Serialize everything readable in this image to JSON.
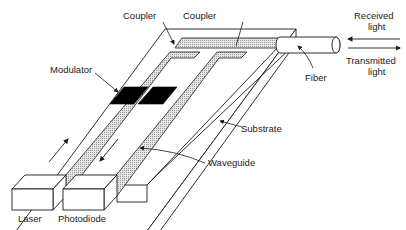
{
  "diagram": {
    "labels": {
      "coupler_left": "Coupler",
      "coupler_right": "Coupler",
      "modulator": "Modulator",
      "fiber": "Fiber",
      "received_line1": "Received",
      "received_line2": "light",
      "transmitted_line1": "Transmitted",
      "transmitted_line2": "light",
      "substrate": "Substrate",
      "waveguide": "Waveguide",
      "laser": "Laser",
      "photodiode": "Photodiode"
    },
    "colors": {
      "line": "#1a1a1a",
      "modulator_fill": "#000000",
      "waveguide_fill": "#d8d8d8",
      "background": "#ffffff"
    },
    "arrows": {
      "received_direction": "left",
      "transmitted_direction": "right",
      "laser_guide_direction": "up",
      "photodiode_guide_direction": "down"
    }
  }
}
